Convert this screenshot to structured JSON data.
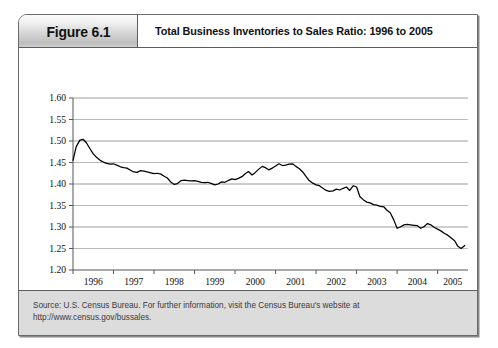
{
  "figure": {
    "number_label": "Figure 6.1",
    "title": "Total Business Inventories to Sales Ratio: 1996 to 2005",
    "source_line_1": "Source: U.S. Census Bureau. For further information, visit the Census Bureau's website at",
    "source_line_2": "http://www.census.gov/bussales."
  },
  "chart_data": {
    "type": "line",
    "title": "Total Business Inventories to Sales Ratio: 1996 to 2005",
    "xlabel": "",
    "ylabel": "",
    "xlim": [
      1996.0,
      2005.75
    ],
    "ylim": [
      1.2,
      1.6
    ],
    "grid": true,
    "legend": false,
    "line_color": "#000000",
    "grid_color": "#999999",
    "axis_color": "#555555",
    "ytick_labels": [
      "1.60",
      "1.55",
      "1.50",
      "1.45",
      "1.40",
      "1.35",
      "1.30",
      "1.25",
      "1.20"
    ],
    "ytick_values": [
      1.6,
      1.55,
      1.5,
      1.45,
      1.4,
      1.35,
      1.3,
      1.25,
      1.2
    ],
    "xtick_labels": [
      "1996",
      "1997",
      "1998",
      "1999",
      "2000",
      "2001",
      "2002",
      "2003",
      "2004",
      "2005"
    ],
    "xtick_values": [
      1996,
      1997,
      1998,
      1999,
      2000,
      2001,
      2002,
      2003,
      2004,
      2005
    ],
    "series": [
      {
        "name": "Inventories to Sales Ratio",
        "x": [
          1996.0,
          1996.08,
          1996.17,
          1996.25,
          1996.33,
          1996.42,
          1996.5,
          1996.58,
          1996.67,
          1996.75,
          1996.83,
          1996.92,
          1997.0,
          1997.08,
          1997.17,
          1997.25,
          1997.33,
          1997.42,
          1997.5,
          1997.58,
          1997.67,
          1997.75,
          1997.83,
          1997.92,
          1998.0,
          1998.08,
          1998.17,
          1998.25,
          1998.33,
          1998.42,
          1998.5,
          1998.58,
          1998.67,
          1998.75,
          1998.83,
          1998.92,
          1999.0,
          1999.08,
          1999.17,
          1999.25,
          1999.33,
          1999.42,
          1999.5,
          1999.58,
          1999.67,
          1999.75,
          1999.83,
          1999.92,
          2000.0,
          2000.08,
          2000.17,
          2000.25,
          2000.33,
          2000.42,
          2000.5,
          2000.58,
          2000.67,
          2000.75,
          2000.83,
          2000.92,
          2001.0,
          2001.08,
          2001.17,
          2001.25,
          2001.33,
          2001.42,
          2001.5,
          2001.58,
          2001.67,
          2001.75,
          2001.83,
          2001.92,
          2002.0,
          2002.08,
          2002.17,
          2002.25,
          2002.33,
          2002.42,
          2002.5,
          2002.58,
          2002.67,
          2002.75,
          2002.83,
          2002.92,
          2003.0,
          2003.08,
          2003.17,
          2003.25,
          2003.33,
          2003.42,
          2003.5,
          2003.58,
          2003.67,
          2003.75,
          2003.83,
          2003.92,
          2004.0,
          2004.08,
          2004.17,
          2004.25,
          2004.33,
          2004.42,
          2004.5,
          2004.58,
          2004.67,
          2004.75,
          2004.83,
          2004.92,
          2005.0,
          2005.08,
          2005.17,
          2005.25,
          2005.33,
          2005.42,
          2005.5,
          2005.58,
          2005.67
        ],
        "y": [
          1.455,
          1.487,
          1.502,
          1.504,
          1.496,
          1.482,
          1.47,
          1.462,
          1.455,
          1.451,
          1.448,
          1.446,
          1.447,
          1.444,
          1.44,
          1.438,
          1.437,
          1.432,
          1.428,
          1.427,
          1.431,
          1.43,
          1.428,
          1.426,
          1.424,
          1.425,
          1.423,
          1.418,
          1.414,
          1.404,
          1.399,
          1.401,
          1.408,
          1.409,
          1.408,
          1.407,
          1.408,
          1.406,
          1.404,
          1.403,
          1.404,
          1.401,
          1.398,
          1.4,
          1.405,
          1.404,
          1.408,
          1.412,
          1.41,
          1.413,
          1.417,
          1.424,
          1.429,
          1.421,
          1.427,
          1.434,
          1.441,
          1.438,
          1.433,
          1.437,
          1.442,
          1.447,
          1.443,
          1.444,
          1.446,
          1.447,
          1.441,
          1.436,
          1.428,
          1.418,
          1.408,
          1.402,
          1.398,
          1.396,
          1.39,
          1.385,
          1.383,
          1.384,
          1.388,
          1.386,
          1.39,
          1.393,
          1.385,
          1.396,
          1.393,
          1.371,
          1.363,
          1.358,
          1.356,
          1.352,
          1.351,
          1.348,
          1.347,
          1.339,
          1.333,
          1.316,
          1.297,
          1.3,
          1.305,
          1.306,
          1.305,
          1.304,
          1.303,
          1.297,
          1.301,
          1.308,
          1.305,
          1.299,
          1.295,
          1.291,
          1.285,
          1.281,
          1.275,
          1.268,
          1.255,
          1.25,
          1.257
        ]
      }
    ]
  }
}
